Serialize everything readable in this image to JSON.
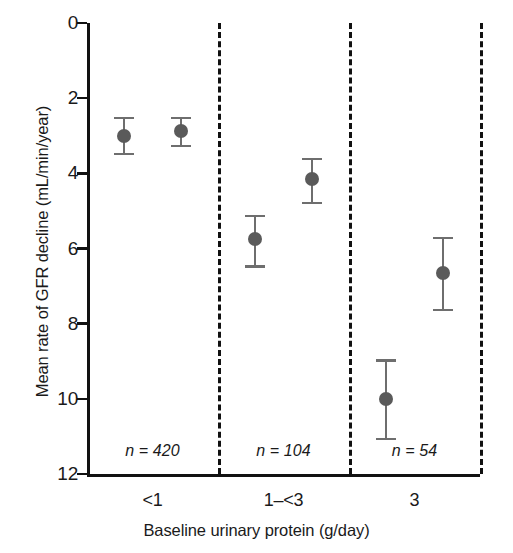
{
  "chart_data": {
    "type": "scatter",
    "title": "",
    "xlabel": "Baseline urinary protein (g/day)",
    "ylabel": "Mean rate of GFR decline (mL/min/year)",
    "ylim": [
      0,
      12
    ],
    "y_inverted": true,
    "grid": false,
    "legend": null,
    "y_ticks": [
      0,
      2,
      4,
      6,
      8,
      10,
      12
    ],
    "y_tick_labels": [
      "0",
      "2",
      "4",
      "6",
      "8",
      "10",
      "12"
    ],
    "groups": [
      {
        "label": "<1",
        "n_label": "n = 420",
        "n": 420,
        "points": [
          {
            "x_frac": 0.28,
            "value": 3.0,
            "low": 2.5,
            "high": 3.45
          },
          {
            "x_frac": 0.72,
            "value": 2.88,
            "low": 2.5,
            "high": 3.25
          }
        ]
      },
      {
        "label": "1–<3",
        "n_label": "n = 104",
        "n": 104,
        "points": [
          {
            "x_frac": 0.28,
            "value": 5.75,
            "low": 5.1,
            "high": 6.45
          },
          {
            "x_frac": 0.72,
            "value": 4.15,
            "low": 3.6,
            "high": 4.75
          }
        ]
      },
      {
        "label": "3",
        "n_label": "n = 54",
        "n": 54,
        "points": [
          {
            "x_frac": 0.28,
            "value": 10.0,
            "low": 8.95,
            "high": 11.05
          },
          {
            "x_frac": 0.72,
            "value": 6.65,
            "low": 5.7,
            "high": 7.6
          }
        ]
      }
    ],
    "series": [
      {
        "name": "first-bar",
        "categories": [
          "<1",
          "1–<3",
          "3"
        ],
        "values": [
          3.0,
          5.75,
          10.0
        ],
        "err_low": [
          2.5,
          5.1,
          8.95
        ],
        "err_high": [
          3.45,
          6.45,
          11.05
        ]
      },
      {
        "name": "second-bar",
        "categories": [
          "<1",
          "1–<3",
          "3"
        ],
        "values": [
          2.88,
          4.15,
          6.65
        ],
        "err_low": [
          2.5,
          3.6,
          5.7
        ],
        "err_high": [
          3.25,
          4.75,
          7.6
        ]
      }
    ],
    "colors": {
      "marker": "#5a5a5a",
      "error_bar": "#6e6e6e",
      "axis": "#111111",
      "divider": "#111111",
      "background": "#ffffff"
    }
  },
  "axes": {
    "y_title": "Mean rate of GFR decline (mL/min/year)",
    "x_title": "Baseline urinary protein (g/day)"
  }
}
